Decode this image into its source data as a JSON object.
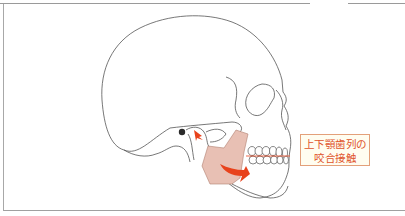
{
  "diagram": {
    "label": {
      "line1": "上下顎歯列の",
      "line2": "咬合接触"
    },
    "colors": {
      "outline": "#555555",
      "muscle_fill": "#e8c0b4",
      "muscle_stroke": "#b08070",
      "arrow": "#e8421c",
      "label_text": "#e0532a",
      "label_border": "#e3a07a",
      "label_bg": "#fffdf0"
    }
  }
}
